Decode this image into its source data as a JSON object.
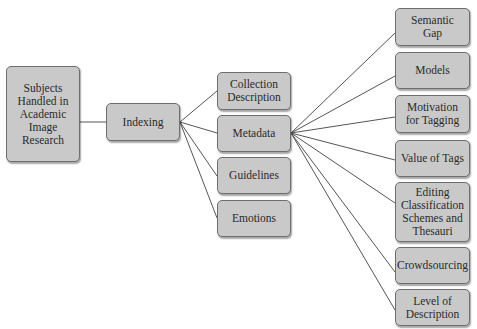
{
  "diagram": {
    "type": "tree",
    "root": {
      "id": "root",
      "label": "Subjects\nHandled in\nAcademic\nImage\nResearch"
    },
    "level1": [
      {
        "id": "indexing",
        "label": "Indexing"
      }
    ],
    "level2": [
      {
        "id": "collection-description",
        "label": "Collection\nDescription"
      },
      {
        "id": "metadata",
        "label": "Metadata"
      },
      {
        "id": "guidelines",
        "label": "Guidelines"
      },
      {
        "id": "emotions",
        "label": "Emotions"
      }
    ],
    "level3": [
      {
        "id": "semantic-gap",
        "label": "Semantic\nGap"
      },
      {
        "id": "models",
        "label": "Models"
      },
      {
        "id": "motivation-for-tagging",
        "label": "Motivation\nfor Tagging"
      },
      {
        "id": "value-of-tags",
        "label": "Value of Tags"
      },
      {
        "id": "editing-classification",
        "label": "Editing\nClassification\nSchemes and\nThesauri"
      },
      {
        "id": "crowdsourcing",
        "label": "Crowdsourcing"
      },
      {
        "id": "level-of-description",
        "label": "Level of\nDescription"
      }
    ],
    "edges": [
      [
        "root",
        "indexing"
      ],
      [
        "indexing",
        "collection-description"
      ],
      [
        "indexing",
        "metadata"
      ],
      [
        "indexing",
        "guidelines"
      ],
      [
        "indexing",
        "emotions"
      ],
      [
        "metadata",
        "semantic-gap"
      ],
      [
        "metadata",
        "models"
      ],
      [
        "metadata",
        "motivation-for-tagging"
      ],
      [
        "metadata",
        "value-of-tags"
      ],
      [
        "metadata",
        "editing-classification"
      ],
      [
        "metadata",
        "crowdsourcing"
      ],
      [
        "metadata",
        "level-of-description"
      ]
    ],
    "colors": {
      "box_fill": "#c9c9c9",
      "box_border": "#6e6e6e",
      "line": "#555555"
    }
  }
}
